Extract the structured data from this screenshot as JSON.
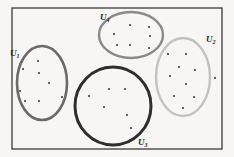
{
  "diagram": {
    "type": "cluster-diagram",
    "frame": {
      "x": 12,
      "y": 8,
      "width": 210,
      "height": 141,
      "color": "#3a3a3a"
    },
    "clusters": [
      {
        "id": "U1",
        "label": "U",
        "subscript": "1",
        "shape": {
          "cx": 42,
          "cy": 83,
          "rx": 25,
          "ry": 37
        },
        "stroke_color": "#6a6a6a",
        "stroke_width": 2.6,
        "label_pos": {
          "x": 10,
          "y": 56
        },
        "points": [
          [
            38,
            61
          ],
          [
            23,
            69
          ],
          [
            39,
            73
          ],
          [
            49,
            83
          ],
          [
            20,
            91
          ],
          [
            25,
            101
          ],
          [
            39,
            101
          ],
          [
            62,
            97
          ]
        ]
      },
      {
        "id": "U4",
        "label": "U",
        "subscript": "4",
        "shape": {
          "cx": 131,
          "cy": 35,
          "rx": 32,
          "ry": 23
        },
        "stroke_color": "#8a8a8a",
        "stroke_width": 2.4,
        "label_pos": {
          "x": 100,
          "y": 20
        },
        "points": [
          [
            130,
            25
          ],
          [
            149,
            27
          ],
          [
            114,
            34
          ],
          [
            150,
            36
          ],
          [
            117,
            45
          ],
          [
            130,
            45
          ],
          [
            149,
            48
          ]
        ]
      },
      {
        "id": "U2",
        "label": "U",
        "subscript": "2",
        "shape": {
          "cx": 183,
          "cy": 77,
          "rx": 27,
          "ry": 39
        },
        "stroke_color": "#c2c2c2",
        "stroke_width": 2.4,
        "label_pos": {
          "x": 206,
          "y": 42
        },
        "points": [
          [
            168,
            54
          ],
          [
            186,
            54
          ],
          [
            179,
            67
          ],
          [
            195,
            70
          ],
          [
            170,
            76
          ],
          [
            215,
            78
          ],
          [
            186,
            84
          ],
          [
            174,
            96
          ],
          [
            194,
            97
          ],
          [
            183,
            108
          ]
        ]
      },
      {
        "id": "U3",
        "label": "U",
        "subscript": "3",
        "shape": {
          "cx": 113,
          "cy": 106,
          "rx": 38,
          "ry": 39
        },
        "stroke_color": "#2e2e2e",
        "stroke_width": 3.0,
        "label_pos": {
          "x": 138,
          "y": 145
        },
        "points": [
          [
            109,
            89
          ],
          [
            125,
            89
          ],
          [
            89,
            96
          ],
          [
            104,
            107
          ],
          [
            127,
            115
          ],
          [
            131,
            128
          ]
        ]
      }
    ]
  }
}
